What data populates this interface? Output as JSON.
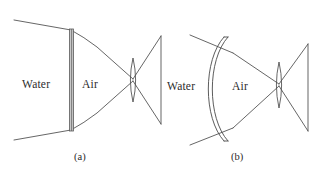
{
  "figure": {
    "background_color": "#ffffff",
    "line_color": "#4a4a4a",
    "plate_fill_color": "#c9c9c9",
    "text_color": "#2b2b2b"
  },
  "panels": [
    {
      "id": "a",
      "caption": "(a)",
      "port_type": "flat-port",
      "labels": {
        "left_medium": "Water",
        "right_medium": "Air"
      },
      "elements": {
        "port": "flat-plate",
        "lens": "biconvex-lens",
        "detector": "image-plane-line"
      }
    },
    {
      "id": "b",
      "caption": "(b)",
      "port_type": "dome-port",
      "labels": {
        "left_medium": "Water",
        "right_medium": "Air"
      },
      "elements": {
        "port": "curved-dome-shell",
        "lens": "biconvex-lens",
        "detector": "image-plane-line"
      }
    }
  ]
}
